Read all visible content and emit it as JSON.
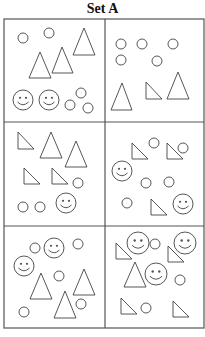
{
  "title": "Set A",
  "colors": {
    "stroke": "#444444",
    "grid": "#555555",
    "background": "#ffffff"
  },
  "grid": {
    "x": 4,
    "y": 19,
    "width": 200,
    "height": 309,
    "col_split": 105,
    "row_splits": [
      122,
      226
    ]
  },
  "panels": [
    {
      "id": 1,
      "circles": [
        [
          23,
          38,
          5
        ],
        [
          49,
          33,
          5
        ],
        [
          70,
          105,
          5
        ],
        [
          81,
          93,
          5
        ],
        [
          88,
          108,
          5
        ]
      ],
      "smileys": [
        [
          23,
          100,
          10
        ],
        [
          49,
          100,
          10
        ]
      ],
      "triangles": [
        [
          [
            84,
            28
          ],
          [
            73,
            55
          ],
          [
            95,
            55
          ]
        ],
        [
          [
            40,
            52
          ],
          [
            29,
            78
          ],
          [
            51,
            78
          ]
        ],
        [
          [
            62,
            47
          ],
          [
            52,
            73
          ],
          [
            73,
            73
          ]
        ]
      ]
    },
    {
      "id": 2,
      "circles": [
        [
          121,
          44,
          5
        ],
        [
          142,
          44,
          5
        ],
        [
          173,
          44,
          5
        ],
        [
          121,
          60,
          5
        ],
        [
          157,
          61,
          5
        ]
      ],
      "smileys": [],
      "triangles": [
        [
          [
            122,
            83
          ],
          [
            111,
            110
          ],
          [
            132,
            110
          ]
        ],
        [
          [
            146,
            82
          ],
          [
            146,
            99
          ],
          [
            162,
            99
          ]
        ],
        [
          [
            178,
            72
          ],
          [
            167,
            99
          ],
          [
            189,
            99
          ]
        ]
      ]
    },
    {
      "id": 3,
      "circles": [
        [
          78,
          183,
          5
        ],
        [
          23,
          207,
          5
        ],
        [
          40,
          207,
          5
        ]
      ],
      "smileys": [
        [
          66,
          203,
          10
        ]
      ],
      "triangles": [
        [
          [
            18,
            132
          ],
          [
            18,
            149
          ],
          [
            34,
            149
          ]
        ],
        [
          [
            51,
            132
          ],
          [
            40,
            158
          ],
          [
            62,
            158
          ]
        ],
        [
          [
            76,
            141
          ],
          [
            65,
            167
          ],
          [
            87,
            167
          ]
        ],
        [
          [
            24,
            168
          ],
          [
            24,
            184
          ],
          [
            40,
            184
          ]
        ],
        [
          [
            52,
            168
          ],
          [
            52,
            184
          ],
          [
            68,
            184
          ]
        ]
      ]
    },
    {
      "id": 4,
      "circles": [
        [
          154,
          143,
          5
        ],
        [
          183,
          148,
          5
        ],
        [
          146,
          183,
          5
        ],
        [
          169,
          182,
          5
        ],
        [
          127,
          203,
          5
        ]
      ],
      "smileys": [
        [
          122,
          171,
          10
        ],
        [
          183,
          204,
          10
        ]
      ],
      "triangles": [
        [
          [
            132,
            143
          ],
          [
            132,
            159
          ],
          [
            148,
            159
          ]
        ],
        [
          [
            167,
            143
          ],
          [
            167,
            159
          ],
          [
            183,
            159
          ]
        ],
        [
          [
            151,
            199
          ],
          [
            151,
            215
          ],
          [
            167,
            215
          ]
        ]
      ]
    },
    {
      "id": 5,
      "circles": [
        [
          35,
          248,
          5
        ],
        [
          78,
          244,
          5
        ],
        [
          59,
          276,
          5
        ],
        [
          81,
          304,
          5
        ],
        [
          24,
          312,
          5
        ]
      ],
      "smileys": [
        [
          54,
          248,
          10
        ],
        [
          24,
          266,
          10
        ]
      ],
      "triangles": [
        [
          [
            41,
            273
          ],
          [
            30,
            299
          ],
          [
            52,
            299
          ]
        ],
        [
          [
            84,
            269
          ],
          [
            73,
            295
          ],
          [
            95,
            295
          ]
        ],
        [
          [
            65,
            291
          ],
          [
            54,
            318
          ],
          [
            76,
            318
          ]
        ]
      ]
    },
    {
      "id": 6,
      "circles": [
        [
          155,
          244,
          5
        ],
        [
          180,
          280,
          5
        ],
        [
          146,
          308,
          5
        ]
      ],
      "smileys": [
        [
          138,
          243,
          11
        ],
        [
          185,
          243,
          11
        ],
        [
          156,
          274,
          11
        ]
      ],
      "triangles": [
        [
          [
            116,
            243
          ],
          [
            116,
            259
          ],
          [
            132,
            259
          ]
        ],
        [
          [
            168,
            246
          ],
          [
            168,
            262
          ],
          [
            184,
            262
          ]
        ],
        [
          [
            135,
            262
          ],
          [
            124,
            287
          ],
          [
            146,
            287
          ]
        ],
        [
          [
            121,
            298
          ],
          [
            121,
            314
          ],
          [
            137,
            314
          ]
        ],
        [
          [
            173,
            301
          ],
          [
            173,
            317
          ],
          [
            189,
            317
          ]
        ]
      ]
    }
  ]
}
